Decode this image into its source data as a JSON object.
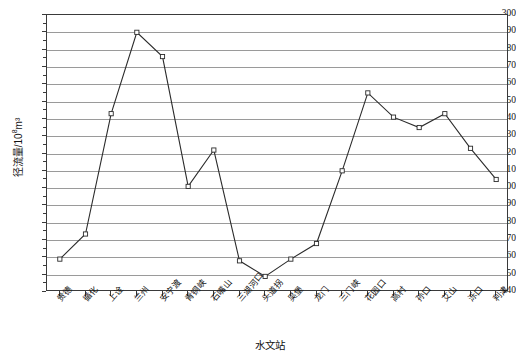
{
  "chart_data": {
    "type": "line",
    "title": "",
    "xlabel": "水文站",
    "ylabel": "径流量/10⁸m³",
    "ylim": [
      140,
      300
    ],
    "ystep": 10,
    "grid": true,
    "legend": "none",
    "marker": "open-square",
    "categories": [
      "贵德",
      "循化",
      "上诠",
      "兰州",
      "安宁渡",
      "青铜峡",
      "石嘴山",
      "三湖河口",
      "头道拐",
      "吴堡",
      "龙门",
      "三门峡",
      "花园口",
      "高村",
      "孙口",
      "艾山",
      "泺口",
      "利津"
    ],
    "values": [
      159,
      173.5,
      243,
      290,
      276,
      201,
      222,
      158,
      149,
      159,
      168,
      210,
      255,
      241,
      235,
      243,
      223,
      205
    ],
    "ytick_labels": [
      "300",
      "290",
      "280",
      "270",
      "260",
      "250",
      "240",
      "230",
      "220",
      "210",
      "200",
      "190",
      "180",
      "170",
      "160",
      "150",
      "140"
    ]
  },
  "axes": {
    "x_title": "水文站",
    "y_title_main": "径流量/10",
    "y_title_sup": "8",
    "y_title_tail": "m³"
  }
}
